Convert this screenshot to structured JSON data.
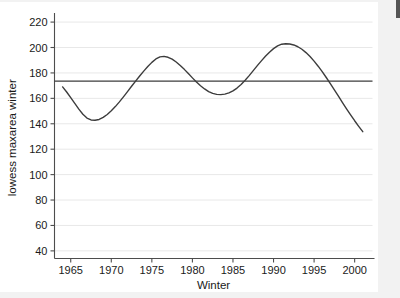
{
  "figure": {
    "background_color": "#f2f2f2",
    "plot_background_color": "#ffffff",
    "grid_color": "#e8e8e8",
    "axis_color": "#4d4d4d",
    "curve_color": "#3c3c3c",
    "reference_line_color": "#3c3c3c"
  },
  "chart_data": {
    "type": "line",
    "title": "",
    "subtitle": "",
    "xlabel": "Winter",
    "ylabel": "lowess maxarea winter",
    "xlim": [
      1963.0,
      2002.2
    ],
    "ylim": [
      34,
      224
    ],
    "xticks": [
      1965,
      1970,
      1975,
      1980,
      1985,
      1990,
      1995,
      2000
    ],
    "xtick_labels": [
      "1965",
      "1970",
      "1975",
      "1980",
      "1985",
      "1990",
      "1995",
      "2000"
    ],
    "yticks": [
      40,
      60,
      80,
      100,
      120,
      140,
      160,
      180,
      200,
      220
    ],
    "ytick_labels": [
      "40",
      "60",
      "80",
      "100",
      "120",
      "140",
      "160",
      "180",
      "200",
      "220"
    ],
    "grid": "horizontal",
    "legend": "none",
    "series": [
      {
        "name": "lowess maxarea winter",
        "type": "line",
        "x": [
          1964.0,
          1964.5,
          1965.0,
          1965.5,
          1966.0,
          1966.5,
          1967.0,
          1967.5,
          1968.0,
          1968.5,
          1969.0,
          1969.5,
          1970.0,
          1970.5,
          1971.0,
          1971.5,
          1972.0,
          1972.5,
          1973.0,
          1973.5,
          1974.0,
          1974.5,
          1975.0,
          1975.5,
          1976.0,
          1976.5,
          1977.0,
          1977.5,
          1978.0,
          1978.5,
          1979.0,
          1979.5,
          1980.0,
          1980.5,
          1981.0,
          1981.5,
          1982.0,
          1982.5,
          1983.0,
          1983.5,
          1984.0,
          1984.5,
          1985.0,
          1985.5,
          1986.0,
          1986.5,
          1987.0,
          1987.5,
          1988.0,
          1988.5,
          1989.0,
          1989.5,
          1990.0,
          1990.5,
          1991.0,
          1991.5,
          1992.0,
          1992.5,
          1993.0,
          1993.5,
          1994.0,
          1994.5,
          1995.0,
          1995.5,
          1996.0,
          1996.5,
          1997.0,
          1997.5,
          1998.0,
          1998.5,
          1999.0,
          1999.5,
          2000.0,
          2000.5,
          2001.0
        ],
        "y": [
          169.0,
          165.0,
          160.5,
          156.0,
          151.5,
          147.5,
          144.5,
          143.0,
          142.8,
          143.4,
          145.0,
          147.3,
          150.2,
          153.5,
          157.2,
          161.2,
          165.3,
          169.5,
          173.6,
          177.6,
          181.4,
          185.0,
          188.3,
          191.0,
          192.6,
          193.0,
          192.3,
          190.8,
          188.6,
          185.9,
          182.8,
          179.5,
          176.1,
          172.8,
          169.9,
          167.4,
          165.3,
          163.9,
          163.1,
          162.9,
          163.3,
          164.3,
          165.9,
          168.1,
          170.9,
          174.2,
          177.9,
          181.8,
          185.7,
          189.5,
          193.1,
          196.3,
          199.1,
          201.3,
          202.6,
          203.0,
          202.8,
          202.0,
          200.6,
          198.6,
          196.0,
          192.9,
          189.3,
          185.3,
          181.0,
          176.4,
          171.6,
          166.7,
          161.7,
          156.7,
          151.8,
          147.0,
          142.4,
          138.0,
          133.8
        ]
      },
      {
        "name": "reference line",
        "type": "hline",
        "y": 173.5
      }
    ],
    "annotations": []
  }
}
